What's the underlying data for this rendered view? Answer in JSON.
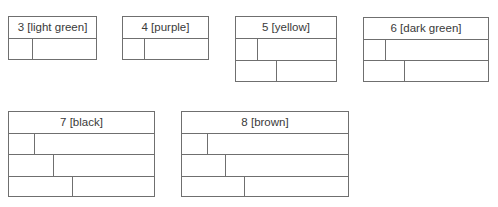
{
  "boxes": [
    {
      "label": "3 [light green]",
      "x": 8,
      "y": 16,
      "w": 89,
      "h": 44,
      "row_splits": [
        23
      ]
    },
    {
      "label": "4 [purple]",
      "x": 122,
      "y": 16,
      "w": 87,
      "h": 44,
      "row_splits": [
        21
      ]
    },
    {
      "label": "5 [yellow]",
      "x": 235,
      "y": 16,
      "w": 102,
      "h": 66,
      "row_splits": [
        21,
        40
      ]
    },
    {
      "label": "6 [dark green]",
      "x": 363,
      "y": 17,
      "w": 126,
      "h": 65,
      "row_splits": [
        21,
        40
      ]
    },
    {
      "label": "7 [black]",
      "x": 8,
      "y": 111,
      "w": 147,
      "h": 86,
      "row_splits": [
        25,
        44,
        63
      ]
    },
    {
      "label": "8 [brown]",
      "x": 181,
      "y": 111,
      "w": 168,
      "h": 86,
      "row_splits": [
        25,
        43,
        62
      ]
    }
  ]
}
